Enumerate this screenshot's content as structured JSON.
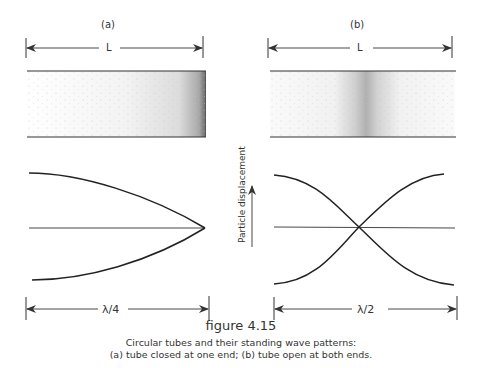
{
  "figure": {
    "number": "figure 4.15",
    "caption_line1": "Circular tubes and their standing wave patterns:",
    "caption_line2": "(a) tube closed at one end; (b) tube open at both ends."
  },
  "panel_a": {
    "label": "(a)",
    "length_label": "L",
    "wavelength_label": "λ/4",
    "description": "tube closed at one end"
  },
  "panel_b": {
    "label": "(b)",
    "length_label": "L",
    "wavelength_label": "λ/2",
    "description": "tube open at both ends"
  },
  "axis": {
    "ylabel": "Particle displacement"
  },
  "colors": {
    "ink": "#333333",
    "background": "#ffffff"
  }
}
